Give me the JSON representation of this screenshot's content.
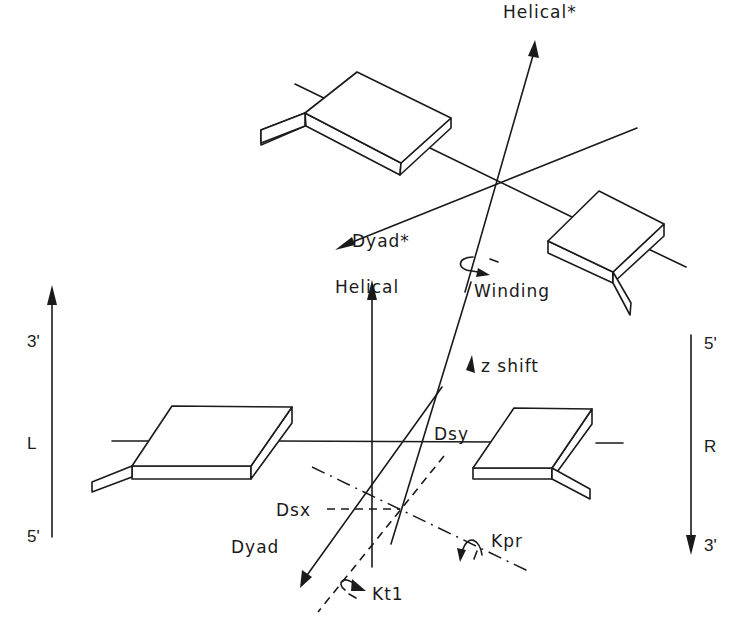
{
  "diagram": {
    "type": "base-pair step geometry schematic",
    "colors": {
      "ink": "#1a1a1a",
      "background": "#ffffff"
    },
    "labels": {
      "helical_star": "Helical*",
      "dyad_star": "Dyad*",
      "winding": "Winding",
      "helical": "Helical",
      "z_shift": "z shift",
      "dsy": "Dsy",
      "dsx": "Dsx",
      "dyad": "Dyad",
      "kpr": "Kpr",
      "ktl": "Kt1"
    },
    "left_strand": {
      "top": "3'",
      "middle": "L",
      "bottom": "5'"
    },
    "right_strand": {
      "top": "5'",
      "middle": "R",
      "bottom": "3'"
    },
    "icons": {
      "winding_rotation": "curved-rotation-arrow",
      "kpr_rotation": "curved-rotation-arrow",
      "ktl_rotation": "curved-rotation-arrow"
    }
  }
}
